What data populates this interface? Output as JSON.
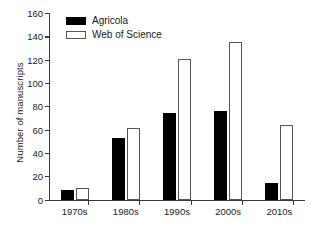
{
  "chart_data": {
    "type": "bar",
    "title": "",
    "xlabel": "",
    "ylabel": "Number of manuscripts",
    "categories": [
      "1970s",
      "1980s",
      "1990s",
      "2000s",
      "2010s"
    ],
    "series": [
      {
        "name": "Agricola",
        "values": [
          8,
          53,
          74,
          76,
          14
        ],
        "color": "#000000",
        "fill": "solid"
      },
      {
        "name": "Web of Science",
        "values": [
          10,
          61,
          121,
          135,
          64
        ],
        "color": "#ffffff",
        "fill": "outline"
      }
    ],
    "ylim": [
      0,
      160
    ],
    "yticks": [
      0,
      20,
      40,
      60,
      80,
      100,
      120,
      140,
      160
    ],
    "ytick_labels": [
      "0",
      "20",
      "40",
      "60",
      "80",
      "100",
      "120",
      "140",
      "160"
    ],
    "grid": false,
    "legend_position": "top-left"
  },
  "legend": {
    "items": [
      {
        "label": "Agricola"
      },
      {
        "label": "Web of Science"
      }
    ]
  }
}
